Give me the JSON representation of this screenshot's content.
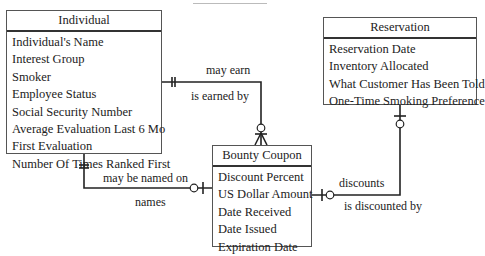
{
  "diagram": {
    "type": "entity-relationship",
    "entities": [
      {
        "id": "individual",
        "name": "Individual",
        "attributes": [
          "Individual's Name",
          "Interest Group",
          "Smoker",
          "Employee Status",
          "Social Security Number",
          "Average Evaluation Last 6 Mo",
          "First Evaluation",
          "Number Of Times Ranked First"
        ]
      },
      {
        "id": "reservation",
        "name": "Reservation",
        "attributes": [
          "Reservation Date",
          "Inventory Allocated",
          "What Customer Has Been Told",
          "One-Time Smoking Preference"
        ]
      },
      {
        "id": "bounty_coupon",
        "name": "Bounty Coupon",
        "attributes": [
          "Discount Percent",
          "US Dollar Amount",
          "Date Received",
          "Date Issued",
          "Expiration Date"
        ]
      }
    ],
    "relationships": [
      {
        "from": "Individual",
        "to": "Bounty Coupon",
        "forward_label": "may earn",
        "reverse_label": "is earned by",
        "from_cardinality": "exactly one",
        "to_cardinality": "zero or many"
      },
      {
        "from": "Individual",
        "to": "Bounty Coupon",
        "forward_label": "may be named on",
        "reverse_label": "names",
        "from_cardinality": "exactly one",
        "to_cardinality": "zero or one"
      },
      {
        "from": "Bounty Coupon",
        "to": "Reservation",
        "forward_label": "discounts",
        "reverse_label": "is discounted by",
        "from_cardinality": "zero or one",
        "to_cardinality": "zero or one"
      }
    ]
  }
}
